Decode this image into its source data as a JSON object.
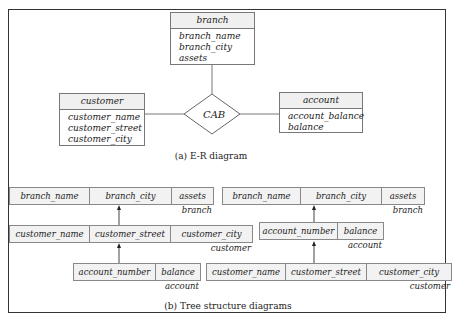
{
  "er_diagram": {
    "caption": "(a) E-R diagram",
    "relationship": "CAB",
    "entities": {
      "branch": {
        "name": "branch",
        "attributes": [
          "branch_name",
          "branch_city",
          "assets"
        ]
      },
      "customer": {
        "name": "customer",
        "attributes": [
          "customer_name",
          "customer_street",
          "customer_city"
        ]
      },
      "account": {
        "name": "account",
        "attributes": [
          "account_balance",
          "balance"
        ]
      }
    }
  },
  "tree_diagrams": {
    "caption": "(b) Tree structure diagrams",
    "left": {
      "root": {
        "label": "branch",
        "fields": [
          "branch_name",
          "branch_city",
          "assets"
        ]
      },
      "middle": {
        "label": "customer",
        "fields": [
          "customer_name",
          "customer_street",
          "customer_city"
        ]
      },
      "leaf": {
        "label": "account",
        "fields": [
          "account_number",
          "balance"
        ]
      }
    },
    "right": {
      "root": {
        "label": "branch",
        "fields": [
          "branch_name",
          "branch_city",
          "assets"
        ]
      },
      "middle": {
        "label": "account",
        "fields": [
          "account_number",
          "balance"
        ]
      },
      "leaf": {
        "label": "customer",
        "fields": [
          "customer_name",
          "customer_street",
          "customer_city"
        ]
      }
    }
  }
}
